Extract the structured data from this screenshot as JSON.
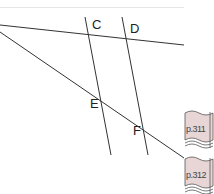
{
  "diagram": {
    "points": [
      {
        "label": "C",
        "x": 92,
        "y": 18
      },
      {
        "label": "D",
        "x": 130,
        "y": 22
      },
      {
        "label": "E",
        "x": 90,
        "y": 100
      },
      {
        "label": "F",
        "x": 133,
        "y": 127
      }
    ],
    "lines": [
      {
        "name": "transversal-top",
        "x1": 0,
        "y1": 25,
        "x2": 184,
        "y2": 45
      },
      {
        "name": "transversal-diagonal",
        "x1": 0,
        "y1": 32,
        "x2": 184,
        "y2": 158
      },
      {
        "name": "line-CE",
        "x1": 85,
        "y1": 17,
        "x2": 111,
        "y2": 155
      },
      {
        "name": "line-DF",
        "x1": 122,
        "y1": 17,
        "x2": 148,
        "y2": 155
      }
    ],
    "line_color": "#333333"
  },
  "page_tabs": [
    {
      "label": "p.311"
    },
    {
      "label": "p.312"
    }
  ],
  "colors": {
    "tab_fill": "#e8d6d6",
    "tab_stroke": "#555555"
  }
}
